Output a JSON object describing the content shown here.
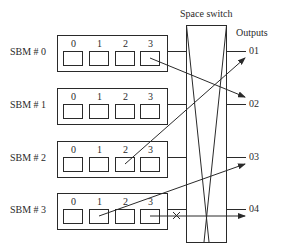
{
  "title": "Space switch",
  "outputs_label": "Outputs",
  "sbms": [
    {
      "label": "SBM # 0",
      "cells": [
        "0",
        "1",
        "2",
        "3"
      ]
    },
    {
      "label": "SBM # 1",
      "cells": [
        "0",
        "1",
        "2",
        "3"
      ]
    },
    {
      "label": "SBM # 2",
      "cells": [
        "0",
        "1",
        "2",
        "3"
      ]
    },
    {
      "label": "SBM # 3",
      "cells": [
        "0",
        "1",
        "2",
        "3"
      ]
    }
  ],
  "outputs": [
    "01",
    "02",
    "03",
    "04"
  ],
  "connections": [
    {
      "from": "SBM # 0 cell 3",
      "to": "02"
    },
    {
      "from": "SBM # 2 cell 2",
      "to": "01"
    },
    {
      "from": "SBM # 3 cell 1",
      "to": "03"
    },
    {
      "from": "SBM # 3 cell 3",
      "to": "04",
      "blocked": true
    }
  ],
  "colors": {
    "line": "#2a2a2a",
    "background": "#ffffff"
  }
}
